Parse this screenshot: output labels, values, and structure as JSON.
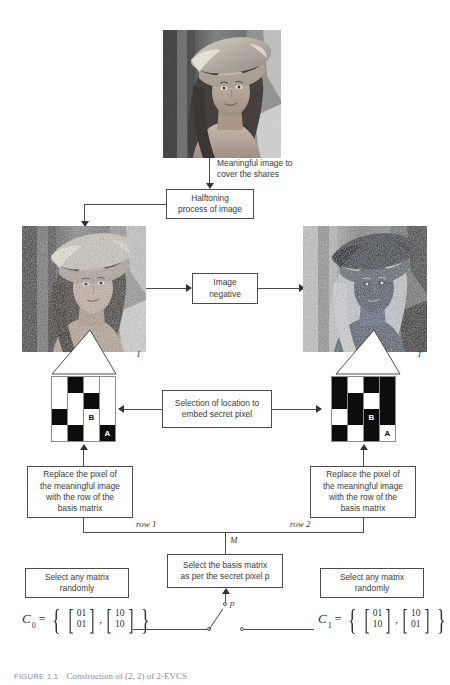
{
  "figure": {
    "caption_label": "FIGURE 1.1",
    "caption_text": "Construction of (2, 2) of 2-EVCS."
  },
  "source_image": {
    "name": "lenna-grayscale",
    "alt": "grayscale photograph of a woman wearing a wide brimmed hat"
  },
  "annotations": {
    "meaningful_image": "Meaningful image to\ncover the shares",
    "share_left_label": "I",
    "share_right_label": "I'",
    "row_left_label": "row 1",
    "row_right_label": "row 2",
    "matrix_selector_label": "M",
    "secret_pixel_label": "p"
  },
  "boxes": {
    "halftoning": "Halftoning\nprocess of image",
    "image_negative": "Image\nnegative",
    "selection": "Selection of location to\nembed secret pixel",
    "replace_left": "Replace the pixel of\nthe meaningful image\nwith the row of the\nbasis matrix",
    "replace_right": "Replace the pixel of\nthe meaningful image\nwith the row of the\nbasis matrix",
    "select_basis": "Select the basis matrix\nas per the  secret pixel p",
    "random_left": "Select any matrix\nrandomly",
    "random_right": "Select any matrix\nrandomly"
  },
  "grids": {
    "left": {
      "name": "halftone-block-I",
      "cells": [
        [
          "w",
          "b",
          "w",
          "w"
        ],
        [
          "w",
          "w",
          "b",
          "w"
        ],
        [
          "b",
          "w",
          "w",
          "w"
        ],
        [
          "w",
          "b",
          "w",
          "b"
        ]
      ],
      "marks": {
        "B": [
          2,
          2
        ],
        "A": [
          3,
          3
        ]
      }
    },
    "right": {
      "name": "halftone-block-I-prime",
      "cells": [
        [
          "b",
          "w",
          "b",
          "b"
        ],
        [
          "b",
          "b",
          "w",
          "b"
        ],
        [
          "w",
          "b",
          "b",
          "b"
        ],
        [
          "b",
          "w",
          "b",
          "w"
        ]
      ],
      "marks": {
        "B": [
          2,
          2
        ],
        "A": [
          3,
          3
        ]
      }
    },
    "mark_a": "A",
    "mark_b": "B"
  },
  "matrices": {
    "c0": {
      "name": "C",
      "subscript": "0",
      "members": [
        {
          "rows": [
            "01",
            "01"
          ]
        },
        {
          "rows": [
            "10",
            "10"
          ]
        }
      ]
    },
    "c1": {
      "name": "C",
      "subscript": "1",
      "members": [
        {
          "rows": [
            "01",
            "10"
          ]
        },
        {
          "rows": [
            "10",
            "01"
          ]
        }
      ]
    }
  },
  "colors": {
    "line": "#4a4a4a",
    "box_border": "#4a4a4a",
    "text": "#3a3a3a",
    "black_pixel": "#0d0d0d",
    "white_pixel": "#ffffff",
    "caption": "#8d8d8d"
  }
}
